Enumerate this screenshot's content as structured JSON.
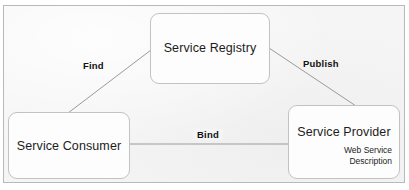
{
  "diagram": {
    "background_color": "#f5f5f5",
    "border_color": "#b9b9b9",
    "node_fill_color": "#fdfdfd",
    "node_border_color": "#c2c2c2",
    "connector_color": "#9a9a9a",
    "text_color": "#1c1c1c",
    "nodes": [
      {
        "id": "registry",
        "label": "Service Registry",
        "x": 150,
        "y": 13,
        "width": 120,
        "height": 71
      },
      {
        "id": "consumer",
        "label": "Service Consumer",
        "x": 8,
        "y": 112,
        "width": 122,
        "height": 67
      },
      {
        "id": "provider",
        "label": "Service Provider",
        "sub_line_1": "Web Service",
        "sub_line_2": "Description",
        "x": 288,
        "y": 105,
        "width": 112,
        "height": 74
      }
    ],
    "edges": [
      {
        "id": "find",
        "label": "Find",
        "from": "consumer",
        "to": "registry",
        "x1": 68,
        "y1": 113,
        "x2": 151,
        "y2": 50
      },
      {
        "id": "publish",
        "label": "Publish",
        "from": "provider",
        "to": "registry",
        "x1": 269,
        "y1": 48,
        "x2": 356,
        "y2": 106
      },
      {
        "id": "bind",
        "label": "Bind",
        "from": "consumer",
        "to": "provider",
        "x1": 130,
        "y1": 144,
        "x2": 288,
        "y2": 144
      }
    ],
    "watermark_text": ""
  }
}
